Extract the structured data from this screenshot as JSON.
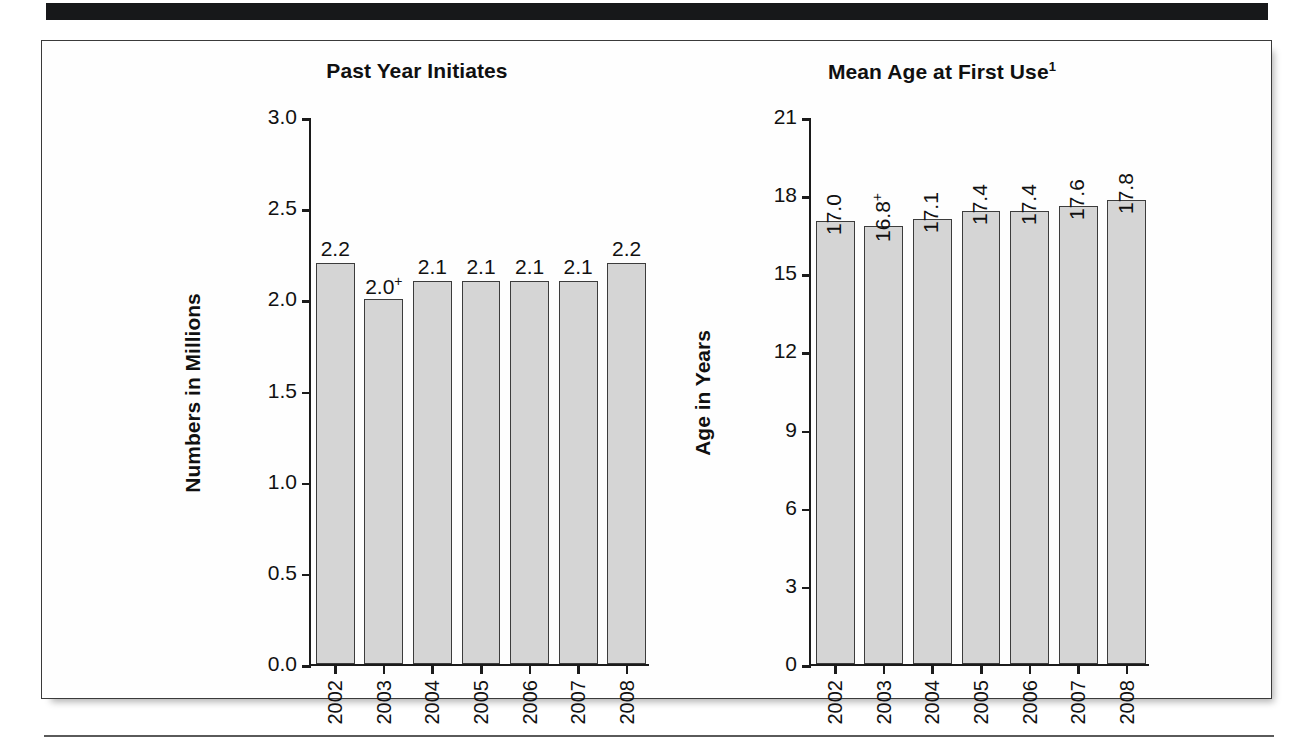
{
  "figure": {
    "background_color": "#ffffff",
    "bar_fill_color": "#d5d5d5",
    "bar_stroke_color": "#3c3c3c",
    "axis_color": "#1b1b1b",
    "rule_color": "#17181a"
  },
  "chart_data": [
    {
      "type": "bar",
      "title": "Past Year Initiates",
      "title_superscript": "",
      "xlabel": "",
      "ylabel": "Numbers in Millions",
      "categories": [
        "2002",
        "2003",
        "2004",
        "2005",
        "2006",
        "2007",
        "2008"
      ],
      "values": [
        2.2,
        2.0,
        2.1,
        2.1,
        2.1,
        2.1,
        2.2
      ],
      "data_labels": [
        "2.2",
        "2.0",
        "2.1",
        "2.1",
        "2.1",
        "2.1",
        "2.2"
      ],
      "data_label_marks": [
        "",
        "+",
        "",
        "",
        "",
        "",
        ""
      ],
      "ylim": [
        0.0,
        3.0
      ],
      "yticks": [
        "3.0",
        "2.5",
        "2.0",
        "1.5",
        "1.0",
        "0.5",
        "0.0"
      ],
      "ytick_values": [
        3.0,
        2.5,
        2.0,
        1.5,
        1.0,
        0.5,
        0.0
      ],
      "grid": false,
      "legend": "none"
    },
    {
      "type": "bar",
      "title": "Mean Age at First Use",
      "title_superscript": "1",
      "xlabel": "",
      "ylabel": "Age in Years",
      "categories": [
        "2002",
        "2003",
        "2004",
        "2005",
        "2006",
        "2007",
        "2008"
      ],
      "values": [
        17.0,
        16.8,
        17.1,
        17.4,
        17.4,
        17.6,
        17.8
      ],
      "data_labels": [
        "17.0",
        "16.8",
        "17.1",
        "17.4",
        "17.4",
        "17.6",
        "17.8"
      ],
      "data_label_marks": [
        "",
        "+",
        "",
        "",
        "",
        "",
        ""
      ],
      "ylim": [
        0,
        21
      ],
      "yticks": [
        "21",
        "18",
        "15",
        "12",
        "9",
        "6",
        "3",
        "0"
      ],
      "ytick_values": [
        21,
        18,
        15,
        12,
        9,
        6,
        3,
        0
      ],
      "grid": false,
      "legend": "none"
    }
  ]
}
